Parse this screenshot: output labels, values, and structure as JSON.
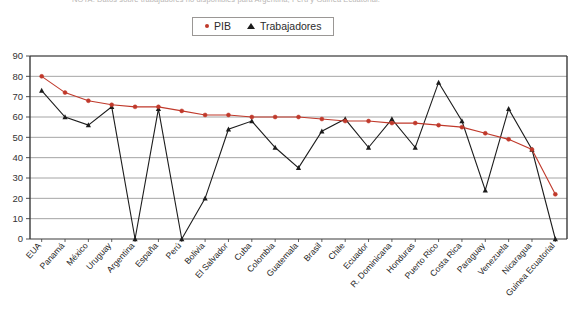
{
  "note": {
    "text": "NOTA: Datos sobre trabajadores no disponibles para Argentina, Perú y Guinea Ecuatorial."
  },
  "legend": {
    "position": "top-center",
    "items": [
      {
        "label": "PIB",
        "marker": "dot-icon",
        "color": "#c0392b"
      },
      {
        "label": "Trabajadores",
        "marker": "triangle-icon",
        "color": "#1c1c1c"
      }
    ]
  },
  "axis": {
    "y_ticks": [
      "0",
      "10",
      "20",
      "30",
      "40",
      "50",
      "60",
      "70",
      "80",
      "90"
    ]
  },
  "chart_data": {
    "type": "line",
    "title": "",
    "subtitle": "",
    "xlabel": "",
    "ylabel": "",
    "ylim": [
      0,
      90
    ],
    "ytick_step": 10,
    "grid": true,
    "legend_position": "top-center",
    "categories": [
      "EUA",
      "Panamá",
      "México",
      "Uruguay",
      "Argentina",
      "España",
      "Perú",
      "Bolivia",
      "El Salvador",
      "Cuba",
      "Colombia",
      "Guatemala",
      "Brasil",
      "Chile",
      "Ecuador",
      "R. Dominicana",
      "Honduras",
      "Puerto Rico",
      "Costa Rica",
      "Paraguay",
      "Venezuela",
      "Nicaragua",
      "Guinea Ecuatorial"
    ],
    "series": [
      {
        "name": "PIB",
        "color": "#c0392b",
        "marker": "dot",
        "values": [
          80,
          72,
          68,
          66,
          65,
          65,
          63,
          61,
          61,
          60,
          60,
          60,
          59,
          58,
          58,
          57,
          57,
          56,
          55,
          52,
          49,
          44,
          22
        ]
      },
      {
        "name": "Trabajadores",
        "color": "#1c1c1c",
        "marker": "triangle",
        "values": [
          73,
          60,
          56,
          65,
          0,
          64,
          0,
          20,
          54,
          58,
          45,
          35,
          53,
          59,
          45,
          59,
          45,
          77,
          58,
          24,
          64,
          44,
          0
        ]
      }
    ]
  }
}
